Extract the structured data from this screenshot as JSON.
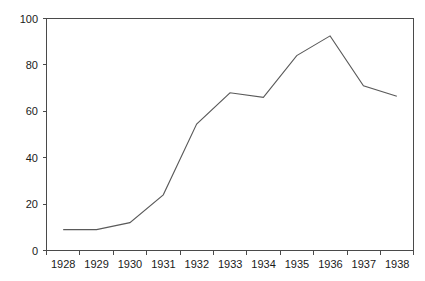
{
  "chart_data": {
    "type": "line",
    "title": "",
    "subtitle": "",
    "xlabel": "",
    "ylabel": "",
    "categories": [
      "1928",
      "1929",
      "1930",
      "1931",
      "1932",
      "1933",
      "1934",
      "1935",
      "1936",
      "1937",
      "1938"
    ],
    "x": [
      1928,
      1929,
      1930,
      1931,
      1932,
      1933,
      1934,
      1935,
      1936,
      1937,
      1938
    ],
    "values": [
      9,
      9,
      12,
      24,
      54.5,
      68,
      66,
      84,
      92.5,
      71,
      66.5
    ],
    "series": [
      {
        "name": "",
        "values": [
          9,
          9,
          12,
          24,
          54.5,
          68,
          66,
          84,
          92.5,
          71,
          66.5
        ]
      }
    ],
    "ylim": [
      0,
      100
    ],
    "yticks": [
      0,
      20,
      40,
      60,
      80,
      100
    ],
    "ytick_labels": [
      "0",
      "20",
      "40",
      "60",
      "80",
      "100"
    ],
    "xtick_labels": [
      "1928",
      "1929",
      "1930",
      "1931",
      "1932",
      "1933",
      "1934",
      "1935",
      "1936",
      "1937",
      "1938"
    ],
    "grid": false,
    "legend": false,
    "legend_position": "none",
    "annotations": [],
    "line_color": "#5a5a5a",
    "axis_color": "#4a4a4a",
    "background_color": "#ffffff",
    "frame": true
  }
}
